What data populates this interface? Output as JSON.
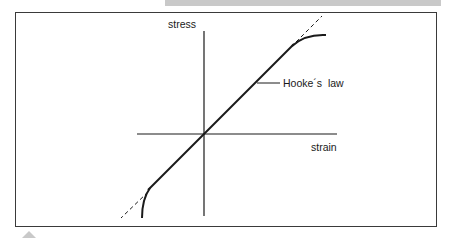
{
  "diagram": {
    "type": "stress-strain",
    "y_axis_label": "stress",
    "x_axis_label": "strain",
    "annotation": "Hooke´s  law",
    "elements": {
      "linear_region": "solid straight line through origin",
      "extrapolation": "dashed straight line extending beyond linear region",
      "nonlinear_ends": "solid curves bending away from the line at both ends"
    },
    "colors": {
      "ink": "#1a1a1a",
      "frame": "#3a3a3a",
      "band": "#c9c9c9",
      "background": "#ffffff"
    }
  }
}
